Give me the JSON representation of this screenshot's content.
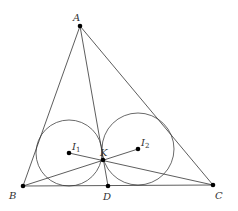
{
  "figure": {
    "stroke_color": "#333333",
    "point_color": "#000000",
    "points": {
      "A": {
        "label": "A",
        "x": 80,
        "y": 26
      },
      "B": {
        "label": "B",
        "x": 23,
        "y": 186
      },
      "C": {
        "label": "C",
        "x": 213,
        "y": 185
      },
      "D": {
        "label": "D",
        "x": 108,
        "y": 186
      },
      "K": {
        "label": "K",
        "x": 103,
        "y": 160
      },
      "I1": {
        "label": "I",
        "sub": "1",
        "x": 69,
        "y": 153
      },
      "I2": {
        "label": "I",
        "sub": "2",
        "x": 138,
        "y": 149
      }
    },
    "circles": [
      {
        "name": "incircle-ABD",
        "cx": 69,
        "cy": 153,
        "r": 33
      },
      {
        "name": "incircle-ADC",
        "cx": 138,
        "cy": 149,
        "r": 36
      }
    ],
    "segments": [
      [
        "A",
        "B"
      ],
      [
        "A",
        "C"
      ],
      [
        "B",
        "C"
      ],
      [
        "A",
        "D"
      ],
      [
        "B",
        "I2"
      ],
      [
        "C",
        "I1"
      ]
    ]
  }
}
